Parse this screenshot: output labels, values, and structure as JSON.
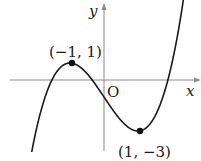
{
  "chart_data": {
    "type": "line",
    "title": "",
    "function": "y = x^3 - 3x - 1",
    "xlabel": "x",
    "ylabel": "y",
    "origin_label": "O",
    "grid": false,
    "legend": null,
    "xlim": [
      -2.6,
      2.8
    ],
    "ylim": [
      -4.1,
      4.6
    ],
    "series": [
      {
        "name": "cubic curve",
        "x": [
          -2.1,
          -1.5,
          -1,
          -0.5,
          0,
          0.5,
          1,
          1.5,
          2,
          2.3
        ],
        "y": [
          -3.96,
          0.125,
          1,
          0.375,
          -1,
          -2.375,
          -3,
          -1.125,
          1,
          4.267
        ]
      }
    ],
    "annotations": [
      {
        "label": "(−1, 1)",
        "x": -1,
        "y": 1,
        "type": "local maximum"
      },
      {
        "label": "(1, −3)",
        "x": 1,
        "y": -3,
        "type": "local minimum"
      }
    ]
  },
  "labels": {
    "x_axis": "x",
    "y_axis": "y",
    "origin": "O",
    "max_point": "(−1, 1)",
    "min_point": "(1, −3)"
  },
  "colors": {
    "axis": "#8a8a8a",
    "curve": "#1a1a1a",
    "point": "#111111"
  }
}
